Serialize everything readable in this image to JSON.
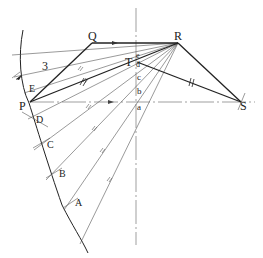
{
  "figure": {
    "type": "geometric construction",
    "points": {
      "P": "P",
      "Q": "Q",
      "R": "R",
      "S": "S",
      "T": "T",
      "arc_points": [
        "A",
        "B",
        "C",
        "D",
        "E"
      ],
      "axis_points": [
        "a",
        "b",
        "c",
        "d",
        "e"
      ]
    },
    "dimension_label": "3",
    "colors": {
      "stroke": "#222222",
      "thin": "#555555",
      "background": "#ffffff"
    }
  }
}
